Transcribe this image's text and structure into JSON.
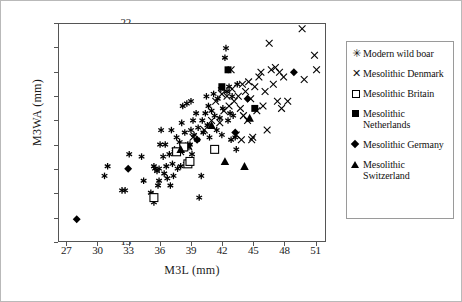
{
  "chart_data": {
    "type": "scatter",
    "title": "",
    "xlabel": "M3L (mm)",
    "ylabel": "M3WA (mm)",
    "xlim": [
      26.2,
      52.0
    ],
    "ylim": [
      13,
      22
    ],
    "xticks": [
      27,
      30,
      33,
      36,
      39,
      42,
      45,
      48,
      51
    ],
    "yticks": [
      13,
      14,
      15,
      16,
      17,
      18,
      19,
      20,
      21,
      22
    ],
    "grid": false,
    "legend_position": "right",
    "series": [
      {
        "name": "Modern wild boar",
        "marker": "asterisk",
        "color": "#000000",
        "points": [
          [
            30.6,
            15.7
          ],
          [
            30.9,
            16.1
          ],
          [
            32.3,
            15.1
          ],
          [
            32.6,
            15.1
          ],
          [
            33.0,
            16.6
          ],
          [
            34.2,
            16.5
          ],
          [
            34.4,
            15.5
          ],
          [
            35.1,
            15.0
          ],
          [
            35.3,
            14.9
          ],
          [
            35.4,
            14.6
          ],
          [
            35.4,
            16.1
          ],
          [
            35.5,
            16.0
          ],
          [
            35.7,
            15.9
          ],
          [
            35.8,
            15.3
          ],
          [
            35.9,
            16.0
          ],
          [
            35.9,
            15.5
          ],
          [
            36.0,
            17.0
          ],
          [
            36.1,
            17.6
          ],
          [
            36.3,
            16.5
          ],
          [
            36.4,
            15.8
          ],
          [
            36.5,
            17.0
          ],
          [
            36.6,
            16.1
          ],
          [
            36.7,
            15.6
          ],
          [
            36.9,
            16.6
          ],
          [
            37.0,
            15.3
          ],
          [
            37.1,
            17.6
          ],
          [
            37.2,
            16.2
          ],
          [
            37.3,
            15.7
          ],
          [
            37.4,
            16.8
          ],
          [
            37.6,
            17.3
          ],
          [
            37.7,
            16.0
          ],
          [
            37.9,
            17.1
          ],
          [
            38.0,
            16.1
          ],
          [
            38.1,
            17.9
          ],
          [
            38.2,
            18.6
          ],
          [
            38.3,
            16.8
          ],
          [
            38.4,
            17.5
          ],
          [
            38.5,
            16.2
          ],
          [
            38.6,
            18.7
          ],
          [
            38.7,
            17.0
          ],
          [
            38.8,
            16.9
          ],
          [
            38.9,
            17.0
          ],
          [
            39.0,
            18.8
          ],
          [
            39.0,
            17.6
          ],
          [
            39.1,
            16.6
          ],
          [
            39.2,
            18.0
          ],
          [
            39.3,
            17.4
          ],
          [
            39.5,
            18.3
          ],
          [
            39.6,
            17.2
          ],
          [
            39.7,
            17.7
          ],
          [
            39.8,
            14.8
          ],
          [
            40.0,
            15.7
          ],
          [
            40.1,
            18.0
          ],
          [
            40.2,
            17.5
          ],
          [
            40.4,
            18.3
          ],
          [
            40.5,
            19.0
          ],
          [
            40.6,
            17.8
          ],
          [
            40.7,
            18.6
          ],
          [
            40.8,
            17.3
          ],
          [
            41.0,
            18.4
          ],
          [
            41.2,
            19.1
          ],
          [
            41.3,
            18.2
          ],
          [
            41.5,
            17.6
          ],
          [
            41.6,
            18.9
          ],
          [
            41.8,
            18.1
          ],
          [
            41.9,
            19.3
          ],
          [
            42.0,
            17.4
          ],
          [
            42.1,
            18.5
          ],
          [
            42.3,
            20.6
          ],
          [
            42.4,
            21.0
          ],
          [
            42.5,
            19.2
          ],
          [
            42.6,
            18.0
          ],
          [
            42.7,
            19.4
          ],
          [
            42.8,
            18.3
          ],
          [
            42.9,
            17.2
          ],
          [
            43.0,
            19.0
          ],
          [
            43.1,
            18.2
          ],
          [
            43.3,
            17.3
          ],
          [
            43.4,
            16.8
          ],
          [
            43.5,
            19.5
          ]
        ]
      },
      {
        "name": "Mesolithic Denmark",
        "marker": "x",
        "color": "#000000",
        "points": [
          [
            38.0,
            16.7
          ],
          [
            38.8,
            16.9
          ],
          [
            39.2,
            17.3
          ],
          [
            40.3,
            17.6
          ],
          [
            41.0,
            18.0
          ],
          [
            41.4,
            18.8
          ],
          [
            41.8,
            17.9
          ],
          [
            42.0,
            19.1
          ],
          [
            42.2,
            18.4
          ],
          [
            42.5,
            19.0
          ],
          [
            42.7,
            18.6
          ],
          [
            43.0,
            19.3
          ],
          [
            43.2,
            18.8
          ],
          [
            43.4,
            17.4
          ],
          [
            43.6,
            19.0
          ],
          [
            43.8,
            18.5
          ],
          [
            44.0,
            19.5
          ],
          [
            44.1,
            18.2
          ],
          [
            44.3,
            19.2
          ],
          [
            44.5,
            18.0
          ],
          [
            44.6,
            19.6
          ],
          [
            44.8,
            18.9
          ],
          [
            45.0,
            17.3
          ],
          [
            45.2,
            19.4
          ],
          [
            45.4,
            18.4
          ],
          [
            45.6,
            19.8
          ],
          [
            45.8,
            20.0
          ],
          [
            46.0,
            18.6
          ],
          [
            46.2,
            19.2
          ],
          [
            46.4,
            17.6
          ],
          [
            46.6,
            21.2
          ],
          [
            46.8,
            20.1
          ],
          [
            47.0,
            19.5
          ],
          [
            47.2,
            20.2
          ],
          [
            47.4,
            18.8
          ],
          [
            47.6,
            20.0
          ],
          [
            47.8,
            18.5
          ],
          [
            48.0,
            19.8
          ],
          [
            48.4,
            18.8
          ],
          [
            49.8,
            21.8
          ],
          [
            50.0,
            19.7
          ],
          [
            51.0,
            20.7
          ],
          [
            51.2,
            20.1
          ],
          [
            44.9,
            17.2
          ],
          [
            43.9,
            17.2
          ],
          [
            42.9,
            20.1
          ]
        ]
      },
      {
        "name": "Mesolithic Britain",
        "marker": "square-open",
        "color": "#000000",
        "points": [
          [
            35.4,
            14.8
          ],
          [
            37.6,
            16.7
          ],
          [
            38.3,
            16.9
          ],
          [
            38.7,
            16.2
          ],
          [
            38.9,
            16.3
          ],
          [
            41.3,
            16.8
          ]
        ]
      },
      {
        "name": "Mesolithic Netherlands",
        "marker": "square-filled",
        "color": "#000000",
        "points": [
          [
            42.0,
            19.4
          ],
          [
            42.6,
            20.1
          ],
          [
            45.2,
            18.5
          ]
        ]
      },
      {
        "name": "Mesolithic Germany",
        "marker": "diamond-filled",
        "color": "#000000",
        "points": [
          [
            27.9,
            13.9
          ],
          [
            32.9,
            16.0
          ],
          [
            39.6,
            17.2
          ],
          [
            43.3,
            17.5
          ],
          [
            44.5,
            18.9
          ],
          [
            49.0,
            20.0
          ]
        ]
      },
      {
        "name": "Mesolithic Switzerland",
        "marker": "triangle-filled",
        "color": "#000000",
        "points": [
          [
            38.0,
            16.8
          ],
          [
            41.0,
            17.8
          ],
          [
            42.3,
            16.3
          ],
          [
            44.2,
            16.1
          ],
          [
            44.7,
            18.1
          ]
        ]
      }
    ]
  },
  "axes": {
    "xlabel": "M3L (mm)",
    "ylabel": "M3WA (mm)",
    "xticks": [
      "27",
      "30",
      "33",
      "36",
      "39",
      "42",
      "45",
      "48",
      "51"
    ],
    "yticks": [
      "22",
      "21",
      "20",
      "19",
      "18",
      "17",
      "16",
      "15",
      "14",
      "13"
    ]
  },
  "legend": {
    "items": [
      {
        "label": "Modern wild boar",
        "marker": "asterisk-icon",
        "glyph": "✳"
      },
      {
        "label": "Mesolithic Denmark",
        "marker": "x-icon",
        "glyph": "✕"
      },
      {
        "label": "Mesolithic Britain",
        "marker": "square-open-icon",
        "glyph": ""
      },
      {
        "label": "Mesolithic Netherlands",
        "marker": "square-filled-icon",
        "glyph": ""
      },
      {
        "label": "Mesolithic Germany",
        "marker": "diamond-filled-icon",
        "glyph": ""
      },
      {
        "label": "Mesolithic Switzerland",
        "marker": "triangle-filled-icon",
        "glyph": ""
      }
    ]
  }
}
